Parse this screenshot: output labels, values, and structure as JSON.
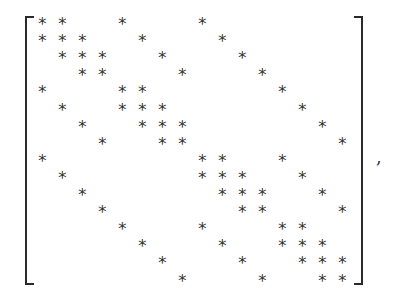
{
  "matrix": {
    "size": 16,
    "symbol": "∗",
    "rows": [
      [
        1,
        2,
        5,
        9
      ],
      [
        1,
        2,
        3,
        6,
        10
      ],
      [
        2,
        3,
        4,
        7,
        11
      ],
      [
        3,
        4,
        8,
        12
      ],
      [
        1,
        5,
        6,
        13
      ],
      [
        2,
        5,
        6,
        7,
        14
      ],
      [
        3,
        6,
        7,
        8,
        15
      ],
      [
        4,
        7,
        8,
        16
      ],
      [
        1,
        9,
        10,
        13
      ],
      [
        2,
        9,
        10,
        11,
        14
      ],
      [
        3,
        10,
        11,
        12,
        15
      ],
      [
        4,
        11,
        12,
        16
      ],
      [
        5,
        9,
        13,
        14
      ],
      [
        6,
        10,
        13,
        14,
        15
      ],
      [
        7,
        11,
        14,
        15,
        16
      ],
      [
        8,
        12,
        15,
        16
      ]
    ]
  },
  "trailing_punctuation": ","
}
